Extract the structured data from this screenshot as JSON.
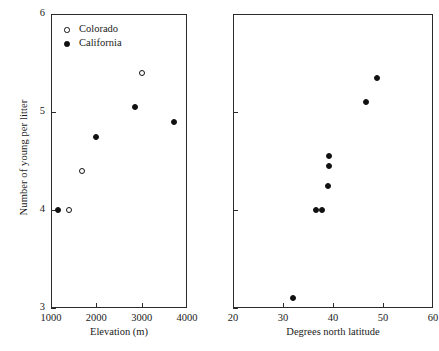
{
  "figure": {
    "ylabel": "Number of young per litter",
    "legend": {
      "items": [
        {
          "label": "Colorado",
          "marker": "open-circle"
        },
        {
          "label": "California",
          "marker": "filled-circle"
        }
      ]
    }
  },
  "chart_data": [
    {
      "type": "scatter",
      "panel": "left",
      "title": "",
      "xlabel": "Elevation (m)",
      "ylabel": "Number of young per litter",
      "xlim": [
        1000,
        4000
      ],
      "ylim": [
        3,
        6
      ],
      "xticks": [
        1000,
        2000,
        3000,
        4000
      ],
      "xticklabels": [
        "1000",
        "2000",
        "3000",
        "4000"
      ],
      "yticks": [
        3,
        4,
        5,
        6
      ],
      "yticklabels": [
        "3",
        "4",
        "5",
        "6"
      ],
      "grid": false,
      "legend_position": "upper-left",
      "series": [
        {
          "name": "Colorado",
          "marker": "open-circle",
          "points": [
            {
              "x": 1400,
              "y": 4.0
            },
            {
              "x": 1680,
              "y": 4.4
            },
            {
              "x": 3000,
              "y": 5.4
            }
          ]
        },
        {
          "name": "California",
          "marker": "filled-circle",
          "points": [
            {
              "x": 1150,
              "y": 4.0
            },
            {
              "x": 2000,
              "y": 4.75
            },
            {
              "x": 2850,
              "y": 5.05
            },
            {
              "x": 3720,
              "y": 4.9
            }
          ]
        }
      ]
    },
    {
      "type": "scatter",
      "panel": "right",
      "title": "",
      "xlabel": "Degrees north latitude",
      "ylabel": "Number of young per litter",
      "xlim": [
        20,
        60
      ],
      "ylim": [
        3,
        6
      ],
      "xticks": [
        20,
        30,
        40,
        50,
        60
      ],
      "xticklabels": [
        "20",
        "30",
        "40",
        "50",
        "60"
      ],
      "yticks": [
        3,
        4,
        5,
        6
      ],
      "yticklabels": [
        "",
        "",
        "",
        ""
      ],
      "grid": false,
      "legend_position": "none",
      "series": [
        {
          "name": "All sites",
          "marker": "filled-circle",
          "points": [
            {
              "x": 32.0,
              "y": 3.1
            },
            {
              "x": 36.6,
              "y": 4.0
            },
            {
              "x": 37.8,
              "y": 4.0
            },
            {
              "x": 39.0,
              "y": 4.25
            },
            {
              "x": 39.2,
              "y": 4.45
            },
            {
              "x": 39.2,
              "y": 4.55
            },
            {
              "x": 46.6,
              "y": 5.1
            },
            {
              "x": 48.8,
              "y": 5.35
            }
          ]
        }
      ]
    }
  ]
}
